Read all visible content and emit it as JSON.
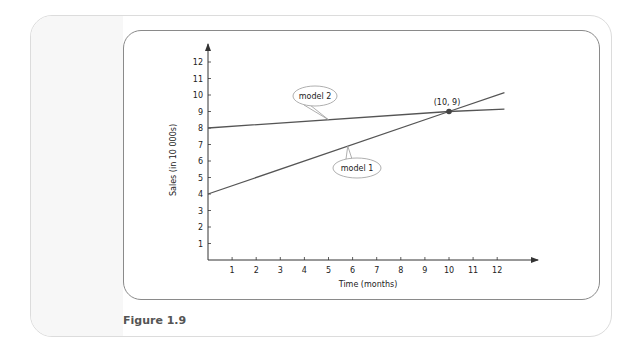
{
  "figure": {
    "caption": "Figure 1.9"
  },
  "colors": {
    "line": "#555555",
    "axis": "#333333",
    "callout_border": "#9a9a9a",
    "outer_border": "#dcdcdc",
    "inner_border": "#8a8a8a",
    "caption": "#555555"
  },
  "chart_data": {
    "type": "line",
    "title": "",
    "xlabel": "Time (months)",
    "ylabel": "Sales (in 10 000s)",
    "xlim": [
      0,
      12.5
    ],
    "ylim": [
      0,
      12.5
    ],
    "x_ticks": [
      1,
      2,
      3,
      4,
      5,
      6,
      7,
      8,
      9,
      10,
      11,
      12
    ],
    "y_ticks": [
      1,
      2,
      3,
      4,
      5,
      6,
      7,
      8,
      9,
      10,
      11,
      12
    ],
    "grid": false,
    "legend": "callouts",
    "series": [
      {
        "name": "model 1",
        "x": [
          0,
          10,
          12.3
        ],
        "y": [
          4,
          9,
          10.15
        ],
        "callout": {
          "label": "model 1",
          "anchor": [
            5.8,
            6.9
          ]
        }
      },
      {
        "name": "model 2",
        "x": [
          0,
          10,
          12.3
        ],
        "y": [
          8,
          9,
          9.15
        ],
        "callout": {
          "label": "model 2",
          "anchor": [
            5,
            8.5
          ]
        }
      }
    ],
    "annotations": [
      {
        "label": "(10, 9)",
        "x": 10,
        "y": 9,
        "type": "intersection-point"
      }
    ]
  }
}
